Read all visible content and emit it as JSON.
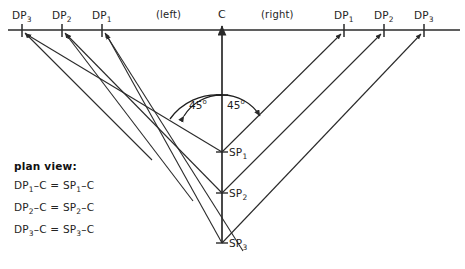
{
  "diagram": {
    "background_color": "#ffffff",
    "line_color": "#2a2a2a",
    "text_color": "#232323",
    "axis": {
      "name": "horizontal-reference-line",
      "y": 30,
      "x_start": 8,
      "x_end": 460
    },
    "center": {
      "label": "C",
      "x": 222,
      "y": 30
    },
    "side_notes": [
      {
        "label": "(left)",
        "x": 158,
        "y": 10
      },
      {
        "label": "(right)",
        "x": 262,
        "y": 10
      }
    ],
    "direct_points_left": [
      {
        "label": "DP",
        "sub": "3",
        "x": 22,
        "label_x": 12,
        "label_y": 10
      },
      {
        "label": "DP",
        "sub": "2",
        "x": 62,
        "label_x": 52,
        "label_y": 10
      },
      {
        "label": "DP",
        "sub": "1",
        "x": 102,
        "label_x": 92,
        "label_y": 10
      }
    ],
    "direct_points_right": [
      {
        "label": "DP",
        "sub": "1",
        "x": 344,
        "label_x": 334,
        "label_y": 10
      },
      {
        "label": "DP",
        "sub": "2",
        "x": 384,
        "label_x": 374,
        "label_y": 10
      },
      {
        "label": "DP",
        "sub": "3",
        "x": 424,
        "label_x": 414,
        "label_y": 10
      }
    ],
    "stereo_points": [
      {
        "label": "SP",
        "sub": "1",
        "x": 222,
        "y": 152,
        "label_x": 228,
        "label_y": 147
      },
      {
        "label": "SP",
        "sub": "2",
        "x": 222,
        "y": 193,
        "label_x": 228,
        "label_y": 188
      },
      {
        "label": "SP",
        "sub": "3",
        "x": 222,
        "y": 243,
        "label_x": 228,
        "label_y": 238
      }
    ],
    "angle_vertex": {
      "x": 222,
      "y": 95
    },
    "angles": [
      {
        "value": "45",
        "unit": "o",
        "label_x": 189,
        "label_y": 98,
        "side": "left"
      },
      {
        "value": "45",
        "unit": "o",
        "label_x": 226,
        "label_y": 98,
        "side": "right"
      }
    ],
    "plan_view": {
      "title": "plan view:",
      "equations": [
        {
          "left_label": "DP",
          "left_sub": "1",
          "right_label": "SP",
          "right_sub": "1",
          "text": "DP₁–C = SP₁–C"
        },
        {
          "left_label": "DP",
          "left_sub": "2",
          "right_label": "SP",
          "right_sub": "2",
          "text": "DP₂–C = SP₂–C"
        },
        {
          "left_label": "DP",
          "left_sub": "3",
          "right_label": "SP",
          "right_sub": "3",
          "text": "DP₃–C = SP₃–C"
        }
      ]
    }
  }
}
